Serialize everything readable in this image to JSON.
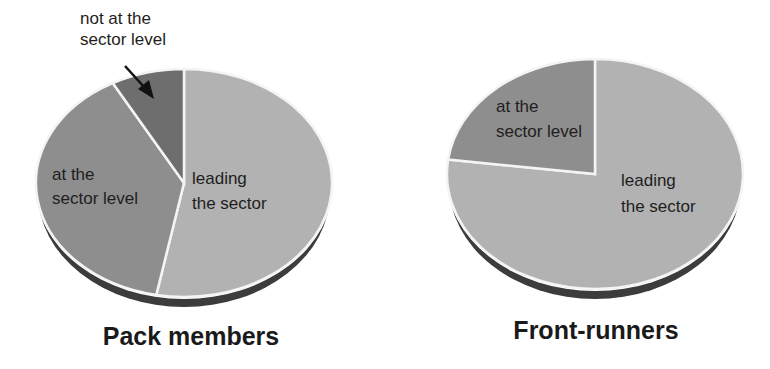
{
  "colors": {
    "leading": "#b2b2b2",
    "at_level": "#8e8e8e",
    "not_at_level": "#6e6e6e",
    "shadow": "#3c3c3c",
    "divider": "#f4f4f4"
  },
  "chart_data": [
    {
      "type": "pie",
      "title": "Pack members",
      "style": "3d-tilted",
      "start_angle": "12 o'clock, clockwise",
      "slices": [
        {
          "label": "leading the sector",
          "value": 53
        },
        {
          "label": "at the sector level",
          "value": 39
        },
        {
          "label": "not at the sector level",
          "value": 8
        }
      ],
      "annotations": [
        {
          "text": "not at the sector level",
          "arrow_to": "not at the sector level slice"
        }
      ]
    },
    {
      "type": "pie",
      "title": "Front-runners",
      "style": "3d-tilted",
      "start_angle": "12 o'clock, clockwise",
      "slices": [
        {
          "label": "leading the sector",
          "value": 77
        },
        {
          "label": "at the sector level",
          "value": 23
        }
      ]
    }
  ],
  "pies": {
    "left": {
      "title": "Pack members",
      "labels": {
        "leading_1": "leading",
        "leading_2": "the sector",
        "at_1": "at the",
        "at_2": "sector level",
        "not_1": "not at the",
        "not_2": "sector level"
      }
    },
    "right": {
      "title": "Front-runners",
      "labels": {
        "leading_1": "leading",
        "leading_2": "the sector",
        "at_1": "at the",
        "at_2": "sector level"
      }
    }
  }
}
